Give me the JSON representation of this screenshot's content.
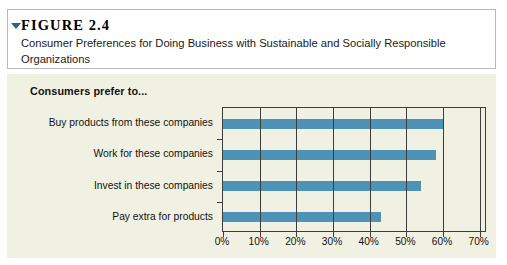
{
  "figure": {
    "marker_icon": "triangle-pointer-icon",
    "number": "FIGURE 2.4",
    "title": "Consumer Preferences for Doing Business with Sustainable and Socially Responsible Organizations"
  },
  "chart_heading": "Consumers prefer to...",
  "colors": {
    "bar": "#4e92b6",
    "panel_background": "#f1f1e3",
    "axis": "#3d3d3d",
    "caption_border": "#b9b9b9",
    "marker": "#2f5f8a"
  },
  "chart_data": {
    "type": "bar",
    "orientation": "horizontal",
    "title": "Consumers prefer to...",
    "xlabel": "",
    "ylabel": "",
    "categories": [
      "Buy products from these companies",
      "Work for these companies",
      "Invest in these companies",
      "Pay extra for products"
    ],
    "values": [
      60,
      58,
      54,
      43
    ],
    "series": [
      {
        "name": "Consumers prefer to...",
        "values": [
          60,
          58,
          54,
          43
        ]
      }
    ],
    "xlim": [
      0,
      72
    ],
    "xticks": [
      0,
      10,
      20,
      30,
      40,
      50,
      60,
      70
    ],
    "xtick_labels": [
      "0%",
      "10%",
      "20%",
      "30%",
      "40%",
      "50%",
      "60%",
      "70%"
    ],
    "grid": true,
    "grid_axis": "x",
    "legend": false,
    "value_format": "percent"
  }
}
